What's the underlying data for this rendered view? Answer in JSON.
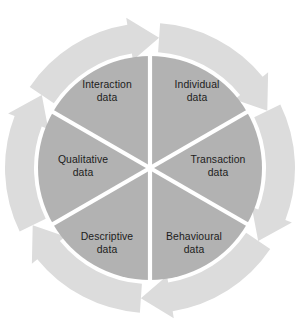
{
  "diagram": {
    "name": "six-segment-data-types-wheel",
    "type": "cycle-wheel",
    "canvas": {
      "width": 299,
      "height": 331
    },
    "background_color": "#ffffff",
    "center": {
      "x": 150,
      "y": 168
    },
    "inner_radius": 112,
    "ring_inner_radius": 116,
    "ring_outer_radius": 145,
    "colors": {
      "segment_fill": "#b2b2b2",
      "arrow_ring_fill": "#dcdcdc",
      "divider": "#ffffff",
      "label_text": "#1c1c1c",
      "background": "#ffffff"
    },
    "flow_direction": "clockwise",
    "arrow_count": 6,
    "segments": [
      {
        "id": "individual-data",
        "line1": "Individual",
        "line2": "data",
        "start_angle_deg": -90,
        "end_angle_deg": -30,
        "label_x": 197,
        "label_y": 88
      },
      {
        "id": "transaction-data",
        "line1": "Transaction",
        "line2": "data",
        "start_angle_deg": -30,
        "end_angle_deg": 30,
        "label_x": 218,
        "label_y": 163
      },
      {
        "id": "behavioural-data",
        "line1": "Behavioural",
        "line2": "data",
        "start_angle_deg": 30,
        "end_angle_deg": 90,
        "label_x": 194,
        "label_y": 240
      },
      {
        "id": "descriptive-data",
        "line1": "Descriptive",
        "line2": "data",
        "start_angle_deg": 90,
        "end_angle_deg": 150,
        "label_x": 107,
        "label_y": 240
      },
      {
        "id": "qualitative-data",
        "line1": "Qualitative",
        "line2": "data",
        "start_angle_deg": 150,
        "end_angle_deg": 210,
        "label_x": 83,
        "label_y": 163
      },
      {
        "id": "interaction-data",
        "line1": "Interaction",
        "line2": "data",
        "start_angle_deg": 210,
        "end_angle_deg": 270,
        "label_x": 107,
        "label_y": 88
      }
    ]
  }
}
